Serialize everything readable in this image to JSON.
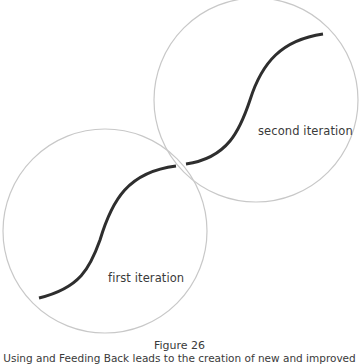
{
  "diagram": {
    "colors": {
      "circle_stroke": "#c8c8c8",
      "curve_stroke": "#2e2e2e",
      "text": "#3a3a3a"
    },
    "iterations": [
      {
        "label": "first iteration"
      },
      {
        "label": "second iteration"
      }
    ]
  },
  "caption": {
    "title": "Figure 26",
    "text": "Using and Feeding Back leads to the creation of new and improved"
  }
}
